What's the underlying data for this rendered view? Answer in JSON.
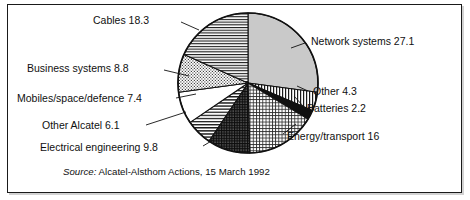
{
  "figure": {
    "source_prefix": "Source:",
    "source_text": "Alcatel-Alsthom Actions, 15 March 1992"
  },
  "chart_data": {
    "type": "pie",
    "title": "",
    "subtitle": "",
    "xlabel": "",
    "ylabel": "",
    "total": 100.0,
    "units": "percent",
    "start_angle_deg": 0,
    "direction": "clockwise",
    "legend": "none",
    "grid": false,
    "labels_inline": true,
    "categories": [
      "Network systems",
      "Other",
      "Batteries",
      "Energy/transport",
      "Electrical engineering",
      "Other Alcatel",
      "Mobiles/space/defence",
      "Business systems",
      "Cables"
    ],
    "values": [
      27.1,
      4.3,
      2.2,
      16,
      9.8,
      6.1,
      7.4,
      8.8,
      18.3
    ],
    "slices": [
      {
        "name": "Network systems",
        "value": 27.1,
        "label": "Network systems 27.1",
        "pattern": "solid-light-gray",
        "fill": "#c9c9c9",
        "label_side": "right"
      },
      {
        "name": "Other",
        "value": 4.3,
        "label": "Other 4.3",
        "pattern": "vertical-stripes",
        "fill": "#ffffff",
        "label_side": "right"
      },
      {
        "name": "Batteries",
        "value": 2.2,
        "label": "Batteries 2.2",
        "pattern": "solid-black",
        "fill": "#111111",
        "label_side": "right"
      },
      {
        "name": "Energy/transport",
        "value": 16,
        "label": "Energy/transport 16",
        "pattern": "fine-grid",
        "fill": "#ffffff",
        "label_side": "right"
      },
      {
        "name": "Electrical engineering",
        "value": 9.8,
        "label": "Electrical engineering 9.8",
        "pattern": "dense-crosshatch-dark",
        "fill": "#6f6f6f",
        "label_side": "left"
      },
      {
        "name": "Other Alcatel",
        "value": 6.1,
        "label": "Other Alcatel 6.1",
        "pattern": "horizontal-lines-medium",
        "fill": "#ffffff",
        "label_side": "left"
      },
      {
        "name": "Mobiles/space/defence",
        "value": 7.4,
        "label": "Mobiles/space/defence 7.4",
        "pattern": "blank-white",
        "fill": "#ffffff",
        "label_side": "left"
      },
      {
        "name": "Business systems",
        "value": 8.8,
        "label": "Business systems 8.8",
        "pattern": "stipple-dots",
        "fill": "#ffffff",
        "label_side": "left"
      },
      {
        "name": "Cables",
        "value": 18.3,
        "label": "Cables 18.3",
        "pattern": "horizontal-lines-fine",
        "fill": "#ffffff",
        "label_side": "left"
      }
    ],
    "colors": {
      "outline": "#111111",
      "background": "#ffffff",
      "text": "#101010"
    }
  }
}
